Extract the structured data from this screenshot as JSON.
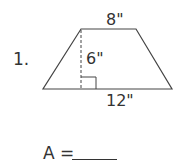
{
  "problem": {
    "number": "1.",
    "top_base": "8\"",
    "height": "6\"",
    "bottom_base": "12\"",
    "answer_label": "A ="
  }
}
